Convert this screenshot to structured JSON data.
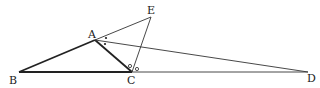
{
  "diagram": {
    "type": "geometry",
    "points": {
      "A": {
        "label": "A",
        "x": 95,
        "y": 40,
        "lx": 88,
        "ly": 38
      },
      "B": {
        "label": "B",
        "x": 19,
        "y": 72,
        "lx": 9,
        "ly": 84
      },
      "C": {
        "label": "C",
        "x": 132,
        "y": 72,
        "lx": 127,
        "ly": 84
      },
      "D": {
        "label": "D",
        "x": 308,
        "y": 72,
        "lx": 307,
        "ly": 82
      },
      "E": {
        "label": "E",
        "x": 151,
        "y": 17,
        "lx": 147,
        "ly": 14
      }
    },
    "segments": [
      {
        "from": "B",
        "to": "A",
        "weight": "thick"
      },
      {
        "from": "A",
        "to": "C",
        "weight": "thick"
      },
      {
        "from": "B",
        "to": "C",
        "weight": "thick"
      },
      {
        "from": "C",
        "to": "D",
        "weight": "thin"
      },
      {
        "from": "A",
        "to": "E",
        "weight": "thin"
      },
      {
        "from": "C",
        "to": "E",
        "weight": "thin"
      },
      {
        "from": "A",
        "to": "D",
        "weight": "thin"
      }
    ],
    "angle_marks": [
      {
        "at": "A",
        "symbol": "dot",
        "count": 2,
        "meaning": "angle EAD equals angle DAC"
      },
      {
        "at": "C",
        "symbol": "circle",
        "count": 2,
        "meaning": "angle ACE equals angle ECD"
      }
    ],
    "colors": {
      "stroke": "#222222",
      "background": "#ffffff"
    }
  }
}
